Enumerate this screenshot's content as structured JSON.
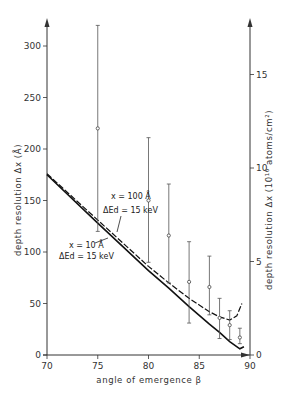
{
  "chart_data": {
    "type": "line",
    "title": "",
    "xlabel": "angle of emergence β",
    "ylabel": "depth resolution Δx (Å)",
    "ylabel_right": "depth resolution Δx (10¹⁶ atoms/cm²)",
    "xlim": [
      70,
      90
    ],
    "ylim": [
      0,
      325
    ],
    "ylim_right": [
      0,
      17.5
    ],
    "x_ticks": [
      "70",
      "75",
      "80",
      "85",
      "90"
    ],
    "y_ticks": [
      "0",
      "50",
      "100",
      "150",
      "200",
      "250",
      "300"
    ],
    "y_ticks_right": [
      "0",
      "5",
      "10",
      "15"
    ],
    "grid": false,
    "series": [
      {
        "name": "x = 100 Å, ΔEd = 15 keV",
        "style": "dashed",
        "x": [
          70,
          75,
          80,
          82,
          84,
          86,
          87,
          88,
          88.7,
          89.2
        ],
        "y": [
          176,
          131,
          86,
          70,
          55,
          42,
          37,
          34,
          38,
          50
        ]
      },
      {
        "name": "x = 10 Å, ΔEd = 15 keV",
        "style": "solid",
        "x": [
          70,
          75,
          80,
          82,
          84,
          86,
          87,
          88,
          89,
          89.4
        ],
        "y": [
          175,
          128,
          82,
          65,
          47,
          30,
          22,
          13,
          6,
          8
        ]
      },
      {
        "name": "measured",
        "style": "errorbar",
        "x": [
          75,
          80,
          82,
          84,
          86,
          87,
          88,
          89
        ],
        "y": [
          220,
          150,
          116,
          71,
          66,
          36,
          29,
          17
        ],
        "y_low": [
          120,
          90,
          70,
          31,
          39,
          16,
          15,
          11
        ],
        "y_high": [
          320,
          211,
          166,
          110,
          96,
          55,
          43,
          26
        ]
      }
    ],
    "annotations": [
      {
        "line1": "x = 100 Å",
        "line2": "ΔEd = 15 keV"
      },
      {
        "line1": "x = 10 Å",
        "line2": "ΔEd = 15 keV"
      }
    ]
  }
}
